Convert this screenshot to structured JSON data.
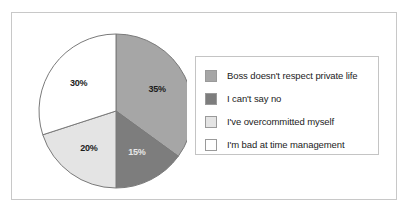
{
  "frame": {
    "border_color": "#c8c8c8",
    "background": "#ffffff"
  },
  "legend": {
    "position": "right",
    "border_color": "#c4c4c4"
  },
  "chart_data": {
    "type": "pie",
    "title": "",
    "xlabel": "",
    "ylabel": "",
    "categories": [
      "Boss doesn't respect private life",
      "I can't say no",
      "I've overcommitted myself",
      "I'm bad at time management"
    ],
    "values": [
      35,
      30,
      20,
      15
    ],
    "slices": [
      {
        "label": "Boss doesn't respect private life",
        "value": 35,
        "data_label": "35%",
        "color": "#a6a6a6",
        "label_color": "#1c1c1c"
      },
      {
        "label": "I can't say no",
        "value": 15,
        "data_label": "15%",
        "color": "#7d7d7d",
        "label_color": "#e8e8e8"
      },
      {
        "label": "I've overcommitted myself",
        "value": 20,
        "data_label": "20%",
        "color": "#e4e4e4",
        "label_color": "#1c1c1c"
      },
      {
        "label": "I'm bad at time management",
        "value": 30,
        "data_label": "30%",
        "color": "#ffffff",
        "label_color": "#1c1c1c"
      }
    ],
    "start_angle": 0,
    "direction": "clockwise",
    "legend_entries": [
      {
        "label": "Boss doesn't respect private life",
        "color": "#a6a6a6"
      },
      {
        "label": "I can't say no",
        "color": "#7d7d7d"
      },
      {
        "label": "I've overcommitted myself",
        "color": "#e4e4e4"
      },
      {
        "label": "I'm bad at time management",
        "color": "#ffffff"
      }
    ],
    "grid": false,
    "legend_position": "right"
  }
}
